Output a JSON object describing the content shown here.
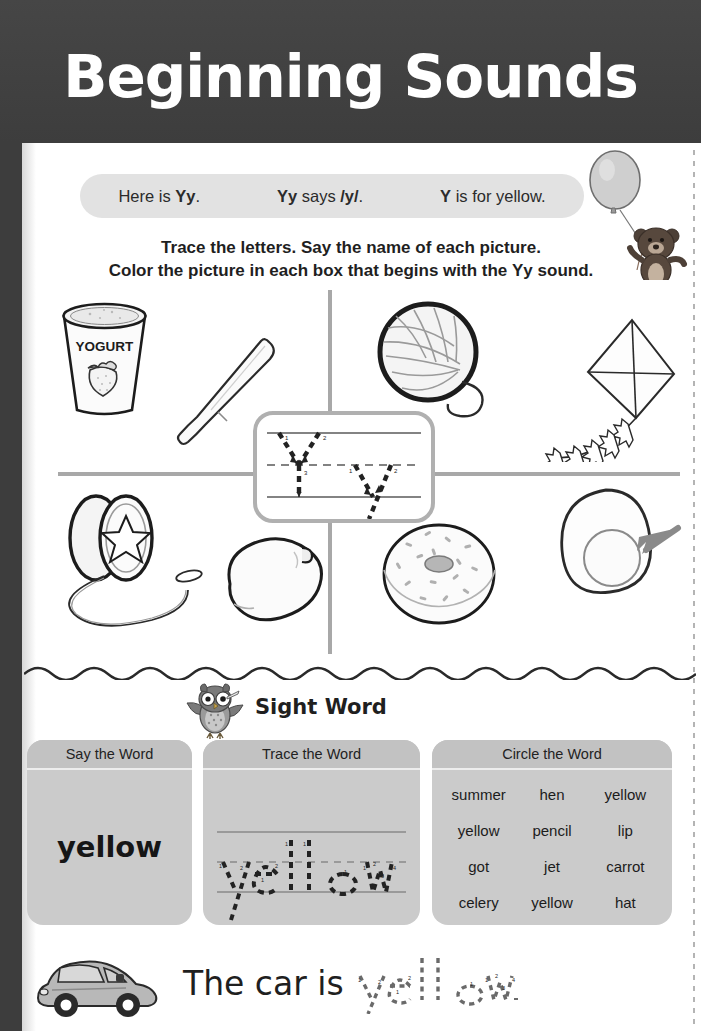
{
  "header": {
    "title": "Beginning Sounds",
    "band_color": "#414141"
  },
  "sound_banner": {
    "cell1_prefix": "Here is ",
    "cell1_letter": "Yy",
    "cell1_suffix": ".",
    "cell2_letter": "Yy",
    "cell2_mid": " says ",
    "cell2_sound": "/y/",
    "cell2_suffix": ".",
    "cell3_letter": "Y",
    "cell3_suffix": " is for yellow.",
    "background": "#e2e2e2"
  },
  "instructions": {
    "line1": "Trace the letters. Say the name of each picture.",
    "line2_a": "Color the picture in each box that begins with the ",
    "line2_letter": "Yy",
    "line2_b": " sound."
  },
  "decorations": {
    "balloon": "balloon-icon",
    "bear": "teddy-bear-icon",
    "owl": "owl-icon",
    "car": "car-icon"
  },
  "picture_grid": {
    "letter_focus": "Yy",
    "cells": [
      {
        "position": "top-left",
        "image": "yogurt-cup-icon",
        "label": "yogurt",
        "begins_with_y": true,
        "cup_text": "YOGURT"
      },
      {
        "position": "top-left-2",
        "image": "knife-icon",
        "label": "knife",
        "begins_with_y": false
      },
      {
        "position": "top-right",
        "image": "yarn-ball-icon",
        "label": "yarn",
        "begins_with_y": true
      },
      {
        "position": "top-right-2",
        "image": "kite-icon",
        "label": "kite",
        "begins_with_y": false
      },
      {
        "position": "bottom-left",
        "image": "yoyo-icon",
        "label": "yo-yo",
        "begins_with_y": true
      },
      {
        "position": "bottom-left-2",
        "image": "lemon-icon",
        "label": "lemon",
        "begins_with_y": false
      },
      {
        "position": "bottom-right",
        "image": "donut-icon",
        "label": "donut",
        "begins_with_y": false
      },
      {
        "position": "bottom-right-2",
        "image": "egg-yolk-icon",
        "label": "yolk",
        "begins_with_y": true
      }
    ],
    "divider_color": "#a8a8a8"
  },
  "trace_box": {
    "uppercase_letter": "Y",
    "lowercase_letter": "y",
    "uppercase_strokes": [
      "1",
      "2",
      "3"
    ],
    "lowercase_strokes": [
      "1",
      "2"
    ],
    "border_color": "#b0b0b0"
  },
  "sight_word_section": {
    "heading": "Sight Word",
    "panels": [
      {
        "title": "Say the Word",
        "word": "yellow"
      },
      {
        "title": "Trace the Word",
        "word": "yellow",
        "stroke_numbers": [
          "1",
          "2",
          "1",
          "2",
          "1",
          "1",
          "1",
          "1",
          "2",
          "3",
          "4"
        ]
      },
      {
        "title": "Circle the Word",
        "words": [
          [
            "summer",
            "hen",
            "yellow"
          ],
          [
            "yellow",
            "pencil",
            "lip"
          ],
          [
            "got",
            "jet",
            "carrot"
          ],
          [
            "celery",
            "yellow",
            "hat"
          ]
        ],
        "target_word": "yellow"
      }
    ],
    "panel_color": "#cbcbcb"
  },
  "bottom_sentence": {
    "text": "The car is",
    "trace_word": "yellow.",
    "image": "car-icon"
  }
}
